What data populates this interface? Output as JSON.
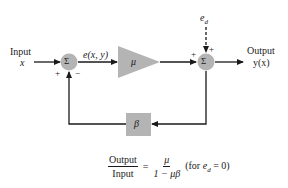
{
  "diagram": {
    "input_label": "Input",
    "input_var": "x",
    "error_label": "e(x, y)",
    "sum1_symbol": "Σ",
    "sum1_plus": "+",
    "sum1_minus": "−",
    "amplifier_gain": "μ",
    "sum2_symbol": "Σ",
    "sum2_plus_left": "+",
    "sum2_plus_top": "+",
    "disturbance": "e",
    "disturbance_sub": "d",
    "output_label": "Output",
    "output_var": "y(x)",
    "feedback_gain": "β",
    "colors": {
      "block_fill": "#b4b4b4",
      "line": "#1a1a1a"
    }
  },
  "equation": {
    "lhs_num": "Output",
    "lhs_den": "Input",
    "equals": "=",
    "rhs_num": "μ",
    "rhs_den": "1 − μβ",
    "condition_prefix": "(for ",
    "condition_var": "e",
    "condition_sub": "d",
    "condition_suffix": " = 0)"
  }
}
